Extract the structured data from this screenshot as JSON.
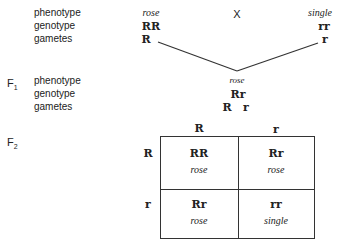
{
  "parents": {
    "labels": [
      "phenotype",
      "genotype",
      "gametes"
    ],
    "cross_symbol": "X",
    "left": {
      "phenotype": "rose",
      "genotype": "RR",
      "gamete": "R"
    },
    "right": {
      "phenotype": "single",
      "genotype": "rr",
      "gamete": "r"
    }
  },
  "f1": {
    "label": "F",
    "label_sub": "1",
    "labels": [
      "phenotype",
      "genotype",
      "gametes"
    ],
    "phenotype": "rose",
    "genotype": "Rr",
    "gametes": [
      "R",
      "r"
    ]
  },
  "f2": {
    "label": "F",
    "label_sub": "2",
    "col_headers": [
      "R",
      "r"
    ],
    "row_headers": [
      "R",
      "r"
    ],
    "cells": [
      [
        {
          "genotype": "RR",
          "phenotype": "rose"
        },
        {
          "genotype": "Rr",
          "phenotype": "rose"
        }
      ],
      [
        {
          "genotype": "Rr",
          "phenotype": "rose"
        },
        {
          "genotype": "rr",
          "phenotype": "single"
        }
      ]
    ]
  }
}
